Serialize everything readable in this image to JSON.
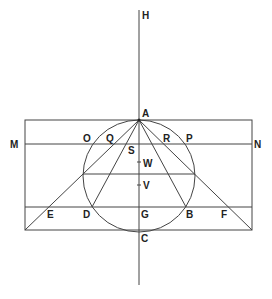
{
  "figure": {
    "type": "geometric-construction",
    "labels": {
      "H": "H",
      "A": "A",
      "M": "M",
      "N": "N",
      "O": "O",
      "Q": "Q",
      "R": "R",
      "P": "P",
      "S": "S",
      "W": "W",
      "V": "V",
      "E": "E",
      "D": "D",
      "G": "G",
      "B": "B",
      "F": "F",
      "C": "C"
    },
    "colors": {
      "line": "#444444",
      "text": "#222222",
      "background": "#ffffff"
    }
  }
}
